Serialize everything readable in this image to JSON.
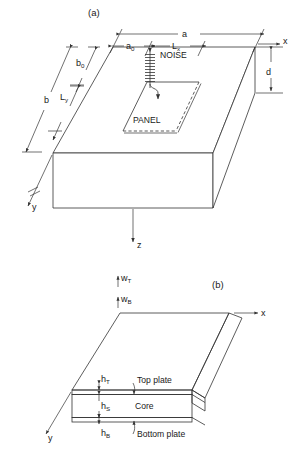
{
  "figure": {
    "title_a": "(a)",
    "title_b": "(b)",
    "panel_a": {
      "caption": "(a)",
      "dimensions": {
        "a": "a",
        "a0": "a",
        "a0_sub": "0",
        "Lx": "L",
        "Lx_sub": "x",
        "b": "b",
        "b0": "b",
        "b0_sub": "0",
        "Ly": "L",
        "Ly_sub": "y",
        "d": "d"
      },
      "labels": {
        "noise": "NOISE",
        "panel": "PANEL"
      },
      "axes": {
        "x": "x",
        "y": "y",
        "z": "z"
      }
    },
    "panel_b": {
      "caption": "(b)",
      "layers": [
        {
          "name": "Top plate",
          "thickness_symbol": "h",
          "thickness_sub": "T"
        },
        {
          "name": "Core",
          "thickness_symbol": "h",
          "thickness_sub": "S"
        },
        {
          "name": "Bottom plate",
          "thickness_symbol": "h",
          "thickness_sub": "B"
        }
      ],
      "displacements": [
        {
          "symbol": "w",
          "sub": "T"
        },
        {
          "symbol": "w",
          "sub": "B"
        }
      ],
      "axes": {
        "x": "x",
        "y": "y"
      }
    },
    "colors": {
      "line": "#333333",
      "text": "#1a1a1a",
      "core_fill": "#ededed",
      "background": "#ffffff"
    }
  }
}
